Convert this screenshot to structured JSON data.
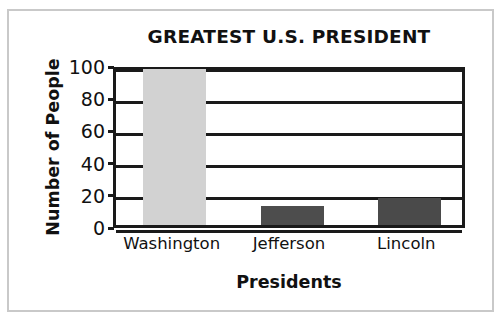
{
  "chart_data": {
    "type": "bar",
    "title": "GREATEST U.S. PRESIDENT",
    "xlabel": "Presidents",
    "ylabel": "Number of People",
    "categories": [
      "Washington",
      "Jefferson",
      "Lincoln"
    ],
    "values": [
      97,
      12,
      17
    ],
    "series": [
      {
        "name": "Number of People",
        "values": [
          97,
          12,
          17
        ]
      }
    ],
    "ylim": [
      0,
      100
    ],
    "yticks": [
      0,
      20,
      40,
      60,
      80,
      100
    ],
    "ytick_labels": [
      "0",
      "20",
      "40",
      "60",
      "80",
      "100"
    ],
    "grid": true,
    "grid_axis": "y",
    "legend": false,
    "legend_position": "none",
    "bar_colors": [
      "#d2d2d2",
      "#4d4d4d",
      "#4a4a4a"
    ],
    "axis_color": "#1a1a1a",
    "background_color": "#ffffff",
    "frame_color": "#c9c9c9"
  },
  "ticks": [
    {
      "label": "100",
      "value": 100
    },
    {
      "label": "80",
      "value": 80
    },
    {
      "label": "60",
      "value": 60
    },
    {
      "label": "40",
      "value": 40
    },
    {
      "label": "20",
      "value": 20
    },
    {
      "label": "0",
      "value": 0
    }
  ],
  "bars": [
    {
      "label": "Washington",
      "value": 97,
      "color": "#d2d2d2"
    },
    {
      "label": "Jefferson",
      "value": 12,
      "color": "#4d4d4d"
    },
    {
      "label": "Lincoln",
      "value": 17,
      "color": "#4a4a4a"
    }
  ]
}
